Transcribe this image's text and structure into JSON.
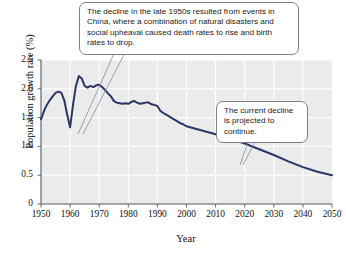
{
  "chart_data": {
    "type": "line",
    "title": "",
    "xlabel": "Year",
    "ylabel": "Population growth rate (%)",
    "xlim": [
      1950,
      2050
    ],
    "ylim": [
      0,
      2.5
    ],
    "xticks": [
      1950,
      1960,
      1970,
      1980,
      1990,
      2000,
      2010,
      2020,
      2030,
      2040,
      2050
    ],
    "yticks": [
      "0",
      "0.5",
      "1.0",
      "1.5",
      "2.0",
      "2.5"
    ],
    "ytick_values": [
      0,
      0.5,
      1.0,
      1.5,
      2.0,
      2.5
    ],
    "grid": true,
    "legend": "none",
    "line_color": "#2b3566",
    "plot_background": "#ebebeb",
    "gridline_color": "#ffffff",
    "series": [
      {
        "name": "World population growth rate",
        "x": [
          1950,
          1951,
          1952,
          1953,
          1954,
          1955,
          1956,
          1957,
          1958,
          1959,
          1960,
          1961,
          1962,
          1963,
          1964,
          1965,
          1966,
          1967,
          1968,
          1969,
          1970,
          1971,
          1972,
          1973,
          1974,
          1975,
          1976,
          1977,
          1978,
          1979,
          1980,
          1981,
          1982,
          1983,
          1984,
          1985,
          1986,
          1987,
          1988,
          1989,
          1990,
          1991,
          1992,
          1993,
          1994,
          1995,
          1996,
          1997,
          1998,
          1999,
          2000,
          2005,
          2010,
          2015,
          2020,
          2025,
          2030,
          2035,
          2040,
          2045,
          2050
        ],
        "values": [
          1.47,
          1.61,
          1.72,
          1.8,
          1.87,
          1.93,
          1.95,
          1.93,
          1.8,
          1.55,
          1.33,
          1.72,
          2.05,
          2.22,
          2.18,
          2.05,
          2.02,
          2.05,
          2.03,
          2.06,
          2.07,
          2.03,
          1.98,
          1.92,
          1.87,
          1.79,
          1.76,
          1.75,
          1.74,
          1.75,
          1.74,
          1.77,
          1.79,
          1.76,
          1.74,
          1.75,
          1.76,
          1.76,
          1.73,
          1.72,
          1.7,
          1.62,
          1.58,
          1.55,
          1.52,
          1.49,
          1.46,
          1.43,
          1.4,
          1.38,
          1.35,
          1.28,
          1.21,
          1.14,
          1.05,
          0.95,
          0.85,
          0.74,
          0.64,
          0.56,
          0.5
        ]
      }
    ],
    "annotations": [
      {
        "id": "china-decline",
        "text": "The decline in the late 1950s resulted from events in China, where a combination of natural disasters and social upheaval caused death rates to rise and birth rates to drop.",
        "points_to_year": 1960
      },
      {
        "id": "projection",
        "text": "The current decline is projected to continue.",
        "points_to_year": 2022
      }
    ]
  }
}
